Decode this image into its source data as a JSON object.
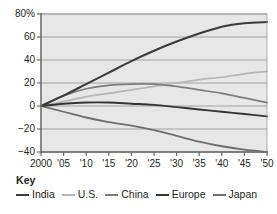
{
  "chart_data": {
    "type": "line",
    "title": "",
    "subtitle": "",
    "xlabel": "",
    "ylabel": "",
    "xlim": [
      2000,
      2050
    ],
    "ylim": [
      -40,
      80
    ],
    "grid": true,
    "legend_position": "below",
    "legend_title": "Key",
    "x_tick_labels": [
      "2000",
      "'05",
      "'10",
      "'15",
      "'20",
      "'25",
      "'30",
      "'35",
      "'40",
      "'45",
      "'50"
    ],
    "x": [
      2000,
      2005,
      2010,
      2015,
      2020,
      2025,
      2030,
      2035,
      2040,
      2045,
      2050
    ],
    "y_tick_labels": [
      "80%",
      "60",
      "40",
      "20",
      "0",
      "−20",
      "−40"
    ],
    "y_ticks": [
      80,
      60,
      40,
      20,
      0,
      -20,
      -40
    ],
    "series": [
      {
        "name": "India",
        "color": "#3b3b3b",
        "width": 2.1,
        "values": [
          0,
          9,
          19,
          29,
          39,
          48,
          56,
          63,
          69,
          72,
          73
        ]
      },
      {
        "name": "U.S.",
        "color": "#b6b6b6",
        "width": 1.7,
        "values": [
          0,
          4,
          8,
          11,
          14,
          17,
          20,
          23,
          25,
          28,
          30
        ]
      },
      {
        "name": "China",
        "color": "#7d7d7d",
        "width": 1.7,
        "values": [
          0,
          9,
          15,
          18,
          19,
          19,
          17,
          14,
          11,
          7,
          3
        ]
      },
      {
        "name": "Europe",
        "color": "#353535",
        "width": 1.9,
        "values": [
          0,
          2,
          3,
          3,
          2,
          1,
          -1,
          -3,
          -5,
          -7,
          -9
        ]
      },
      {
        "name": "Japan",
        "color": "#6e6e6e",
        "width": 1.8,
        "values": [
          0,
          -5,
          -10,
          -14,
          -17,
          -21,
          -26,
          -31,
          -35,
          -38,
          -40
        ]
      }
    ]
  },
  "axes": {
    "background": "#e7e7e7",
    "grid_color": "#9a9a9a",
    "frame_color": "#6b6b6b"
  },
  "legend": {
    "title": "Key",
    "items": [
      {
        "label": "India",
        "color": "#3b3b3b"
      },
      {
        "label": "U.S.",
        "color": "#b6b6b6"
      },
      {
        "label": "China",
        "color": "#7d7d7d"
      },
      {
        "label": "Europe",
        "color": "#353535"
      },
      {
        "label": "Japan",
        "color": "#6e6e6e"
      }
    ]
  }
}
